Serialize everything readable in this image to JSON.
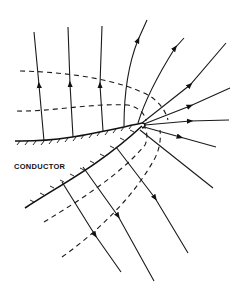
{
  "diagram": {
    "label": "CONDUCTOR",
    "colors": {
      "line": "#1a1a1a",
      "background": "#ffffff"
    },
    "field_lines_count": 13,
    "equipotential_lines_count": 4
  }
}
